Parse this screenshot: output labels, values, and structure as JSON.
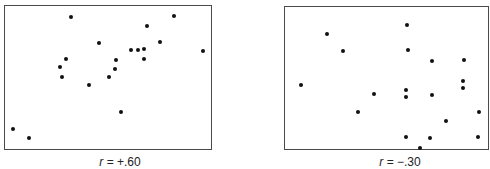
{
  "chart_data": [
    {
      "type": "scatter",
      "title": "",
      "xlabel": "",
      "ylabel": "",
      "grid": false,
      "annotation": "r = +.60",
      "r_symbol": "r",
      "r_value": "= +.60",
      "frame": {
        "left": 4,
        "top": 5,
        "width": 208,
        "height": 145
      },
      "caption_center_x": 120,
      "points_px": [
        [
          66,
          11
        ],
        [
          169,
          10
        ],
        [
          142,
          20
        ],
        [
          94,
          37
        ],
        [
          155,
          36
        ],
        [
          126,
          44
        ],
        [
          133,
          44
        ],
        [
          139,
          43
        ],
        [
          198,
          45
        ],
        [
          61,
          53
        ],
        [
          111,
          54
        ],
        [
          139,
          53
        ],
        [
          55,
          61
        ],
        [
          110,
          63
        ],
        [
          57,
          71
        ],
        [
          104,
          71
        ],
        [
          84,
          79
        ],
        [
          116,
          106
        ],
        [
          8,
          123
        ],
        [
          24,
          132
        ]
      ]
    },
    {
      "type": "scatter",
      "title": "",
      "xlabel": "",
      "ylabel": "",
      "grid": false,
      "annotation": "r = −.30",
      "r_symbol": "r",
      "r_value": "= −.30",
      "frame": {
        "left": 284,
        "top": 6,
        "width": 205,
        "height": 144
      },
      "caption_center_x": 400,
      "points_px": [
        [
          122,
          18
        ],
        [
          42,
          27
        ],
        [
          58,
          44
        ],
        [
          123,
          43
        ],
        [
          147,
          54
        ],
        [
          179,
          53
        ],
        [
          178,
          74
        ],
        [
          178,
          81
        ],
        [
          16,
          78
        ],
        [
          89,
          87
        ],
        [
          121,
          83
        ],
        [
          121,
          90
        ],
        [
          147,
          88
        ],
        [
          73,
          105
        ],
        [
          194,
          105
        ],
        [
          161,
          114
        ],
        [
          121,
          130
        ],
        [
          145,
          131
        ],
        [
          193,
          130
        ],
        [
          135,
          141
        ]
      ]
    }
  ],
  "colors": {
    "dot": "#111111",
    "frame": "#4a4a4a",
    "background": "#ffffff"
  }
}
